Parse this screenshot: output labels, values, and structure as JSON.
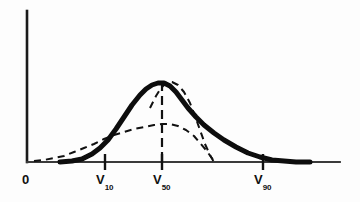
{
  "figure": {
    "background_color": "#fdfdfd",
    "ink_color": "#111111",
    "axis_color": "#2a2a2a"
  },
  "axes": {
    "y_axis": {
      "name": "vertical-axis",
      "x": 27,
      "y_top": 11,
      "y_bottom": 162
    },
    "x_axis": {
      "name": "horizontal-axis",
      "y": 162,
      "x_left": 27,
      "x_right": 340
    },
    "origin_label": {
      "text": "0",
      "subscript": ""
    },
    "ticks": [
      {
        "id": "v10",
        "x": 105,
        "label_base": "V",
        "label_sub": "10"
      },
      {
        "id": "v50",
        "x": 162,
        "label_base": "V",
        "label_sub": "50"
      },
      {
        "id": "v90",
        "x": 263,
        "label_base": "V",
        "label_sub": "90"
      }
    ]
  },
  "median_line": {
    "name": "median-reference-line",
    "x": 162,
    "y_top": 82,
    "y_bottom": 162,
    "style": "dashed"
  },
  "chart_data": {
    "type": "line",
    "title": "",
    "subtitle": "",
    "xlabel": "",
    "ylabel": "",
    "grid": false,
    "legend_position": "none",
    "xlim": [
      27,
      340
    ],
    "ylim": [
      162,
      11
    ],
    "x_tick_labels": [
      "0",
      "V10",
      "V50",
      "V90"
    ],
    "x_tick_positions": [
      27,
      105,
      162,
      263
    ],
    "annotations": [
      {
        "text": "0",
        "x": 27,
        "y": 178
      },
      {
        "text": "V10",
        "x": 105,
        "y": 178
      },
      {
        "text": "V50",
        "x": 162,
        "y": 178
      },
      {
        "text": "V90",
        "x": 263,
        "y": 178
      }
    ],
    "series": [
      {
        "name": "skewed-distribution-solid",
        "style": "solid",
        "linewidth": 5,
        "points": [
          [
            60,
            162
          ],
          [
            72,
            161
          ],
          [
            82,
            159
          ],
          [
            92,
            154
          ],
          [
            100,
            148
          ],
          [
            108,
            140
          ],
          [
            116,
            129
          ],
          [
            124,
            117
          ],
          [
            132,
            105
          ],
          [
            140,
            95
          ],
          [
            146,
            89
          ],
          [
            152,
            85
          ],
          [
            158,
            83
          ],
          [
            164,
            83
          ],
          [
            170,
            86
          ],
          [
            176,
            92
          ],
          [
            182,
            100
          ],
          [
            188,
            108
          ],
          [
            196,
            117
          ],
          [
            204,
            125
          ],
          [
            214,
            133
          ],
          [
            224,
            140
          ],
          [
            236,
            147
          ],
          [
            248,
            153
          ],
          [
            260,
            157
          ],
          [
            272,
            160
          ],
          [
            284,
            161
          ],
          [
            296,
            162
          ],
          [
            310,
            162
          ]
        ]
      },
      {
        "name": "broad-distribution-dashed",
        "style": "dashed",
        "linewidth": 2,
        "points": [
          [
            34,
            161
          ],
          [
            44,
            160
          ],
          [
            54,
            158
          ],
          [
            64,
            156
          ],
          [
            74,
            152
          ],
          [
            84,
            148
          ],
          [
            94,
            144
          ],
          [
            104,
            139
          ],
          [
            114,
            135
          ],
          [
            124,
            132
          ],
          [
            134,
            129
          ],
          [
            144,
            127
          ],
          [
            154,
            125
          ],
          [
            162,
            124
          ],
          [
            170,
            124
          ],
          [
            178,
            126
          ],
          [
            186,
            130
          ],
          [
            194,
            136
          ],
          [
            200,
            143
          ],
          [
            206,
            150
          ],
          [
            211,
            157
          ],
          [
            215,
            162
          ]
        ]
      },
      {
        "name": "narrow-peak-dashed",
        "style": "dashed",
        "linewidth": 2,
        "points": [
          [
            150,
            108
          ],
          [
            156,
            96
          ],
          [
            161,
            88
          ],
          [
            166,
            83
          ],
          [
            172,
            82
          ],
          [
            178,
            85
          ],
          [
            184,
            92
          ],
          [
            190,
            103
          ],
          [
            195,
            116
          ],
          [
            200,
            130
          ],
          [
            205,
            144
          ],
          [
            210,
            155
          ],
          [
            214,
            162
          ]
        ]
      }
    ]
  }
}
